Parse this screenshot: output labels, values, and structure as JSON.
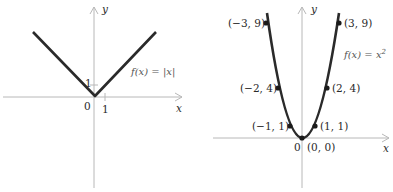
{
  "left_graph": {
    "function_label": "f(x) = |x|",
    "axis_x_label": "x",
    "axis_y_label": "y",
    "origin_label": "0",
    "x_tick_label": "1",
    "y_tick_label": "1",
    "curve_color": "#2a2a2a",
    "axis_color": "#b8b8b8"
  },
  "right_graph": {
    "function_label": "f(x) = x",
    "function_exponent": "2",
    "axis_x_label": "x",
    "axis_y_label": "y",
    "origin_label": "0",
    "points": [
      {
        "label": "(−3, 9)",
        "x": -3,
        "y": 9
      },
      {
        "label": "(3, 9)",
        "x": 3,
        "y": 9
      },
      {
        "label": "(−2, 4)",
        "x": -2,
        "y": 4
      },
      {
        "label": "(2, 4)",
        "x": 2,
        "y": 4
      },
      {
        "label": "(−1, 1)",
        "x": -1,
        "y": 1
      },
      {
        "label": "(1, 1)",
        "x": 1,
        "y": 1
      },
      {
        "label": "(0, 0)",
        "x": 0,
        "y": 0
      }
    ],
    "curve_color": "#2a2a2a",
    "axis_color": "#b8b8b8"
  }
}
